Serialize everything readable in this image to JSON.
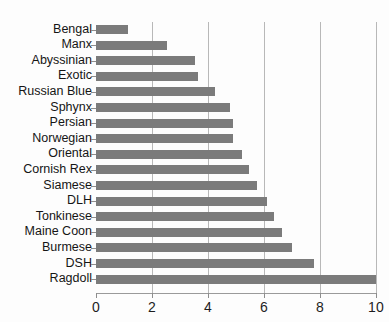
{
  "chart_data": {
    "type": "bar",
    "orientation": "horizontal",
    "title": "",
    "subtitle": "",
    "xlabel": "",
    "ylabel": "",
    "xlim": [
      0,
      10
    ],
    "xticks": [
      "0",
      "2",
      "4",
      "6",
      "8",
      "10"
    ],
    "xtick_values": [
      0,
      2,
      4,
      6,
      8,
      10
    ],
    "grid": "vertical",
    "legend": "none",
    "bar_color": "#7b7b7b",
    "background_color": "#fdfdfd",
    "gridline_color": "#b8b8b8",
    "axis_color": "#9a9a9a",
    "categories": [
      "Bengal",
      "Manx",
      "Abyssinian",
      "Exotic",
      "Russian Blue",
      "Sphynx",
      "Persian",
      "Norwegian",
      "Oriental",
      "Cornish Rex",
      "Siamese",
      "DLH",
      "Tonkinese",
      "Maine Coon",
      "Burmese",
      "DSH",
      "Ragdoll"
    ],
    "values": [
      1.15,
      2.55,
      3.55,
      3.65,
      4.25,
      4.8,
      4.9,
      4.9,
      5.2,
      5.45,
      5.75,
      6.1,
      6.35,
      6.65,
      7.0,
      7.8,
      10.0
    ]
  }
}
